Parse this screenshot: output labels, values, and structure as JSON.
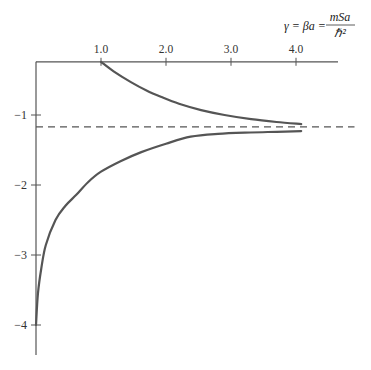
{
  "chart_data": {
    "type": "line",
    "title": "",
    "xlabel": "γ = βa = mSa / ℏ²",
    "xlabel_parts": {
      "lhs": "γ = βa = ",
      "numerator": "mSa",
      "denominator": "ℏ²"
    },
    "ylabel": "",
    "xlim": [
      0,
      4.6
    ],
    "ylim": [
      -4.45,
      0.24
    ],
    "x_axis_at_y": -0.24,
    "x_ticks": [
      1.0,
      2.0,
      3.0,
      4.0
    ],
    "x_tick_labels": [
      "1.0",
      "2.0",
      "3.0",
      "4.0"
    ],
    "y_ticks": [
      -1,
      -2,
      -3,
      -4
    ],
    "y_tick_labels": [
      "−1",
      "−2",
      "−3",
      "−4"
    ],
    "grid": false,
    "legend": "none",
    "series": [
      {
        "name": "upper-branch",
        "style": "solid",
        "x": [
          1.0,
          1.2,
          1.46,
          1.7,
          1.92,
          2.2,
          2.54,
          2.9,
          3.31,
          3.7,
          4.08
        ],
        "y": [
          -0.24,
          -0.38,
          -0.53,
          -0.65,
          -0.74,
          -0.84,
          -0.93,
          -1.0,
          -1.06,
          -1.1,
          -1.13
        ]
      },
      {
        "name": "lower-branch",
        "style": "solid",
        "x": [
          0.0,
          0.03,
          0.08,
          0.15,
          0.3,
          0.45,
          0.62,
          0.8,
          1.0,
          1.3,
          1.62,
          2.0,
          2.38,
          2.8,
          3.3,
          3.7,
          4.08
        ],
        "y": [
          -4.0,
          -3.55,
          -3.2,
          -2.86,
          -2.5,
          -2.3,
          -2.14,
          -1.96,
          -1.81,
          -1.66,
          -1.53,
          -1.41,
          -1.31,
          -1.27,
          -1.25,
          -1.24,
          -1.23
        ]
      },
      {
        "name": "asymptote",
        "style": "dashed",
        "x": [
          0.0,
          4.9
        ],
        "y": [
          -1.17,
          -1.17
        ]
      }
    ]
  }
}
